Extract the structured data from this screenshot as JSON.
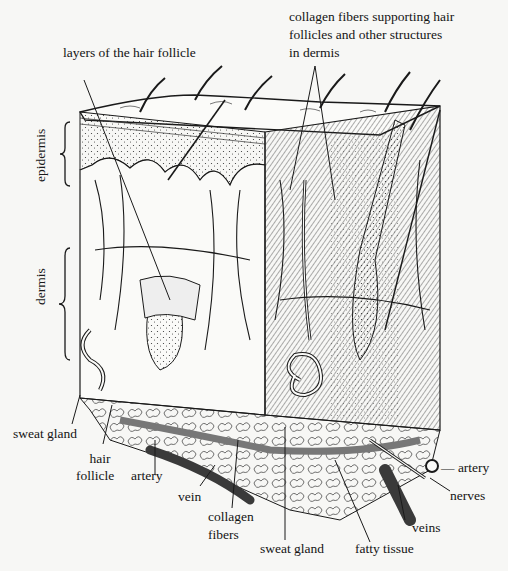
{
  "diagram": {
    "colors": {
      "ink": "#1a1a1a",
      "paper": "#f7f7f5",
      "vessel": "#3a3a3a"
    }
  },
  "labels": {
    "layers_hair_follicle": "layers of the hair follicle",
    "collagen_top_1": "collagen fibers supporting hair",
    "collagen_top_2": "follicles and other structures",
    "collagen_top_3": "in dermis",
    "epidermis": "epidermis",
    "dermis": "dermis",
    "sweat_gland_left": "sweat gland",
    "hair_follicle_1": "hair",
    "hair_follicle_2": "follicle",
    "artery_left": "artery",
    "vein": "vein",
    "collagen_bottom_1": "collagen",
    "collagen_bottom_2": "fibers",
    "sweat_gland_bottom": "sweat gland",
    "fatty_tissue": "fatty tissue",
    "veins": "veins",
    "nerves": "nerves",
    "artery_right": "— artery"
  }
}
